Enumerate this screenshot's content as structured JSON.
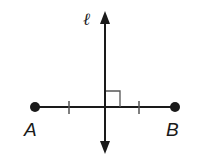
{
  "diagram": {
    "type": "perpendicular-bisector",
    "colors": {
      "stroke": "#1a1a1a",
      "background": "#ffffff",
      "marker": "#555555"
    },
    "line": {
      "label": "ℓ",
      "x": 105,
      "y_top": 12,
      "y_bottom": 153,
      "arrows": "both"
    },
    "segment": {
      "y": 107,
      "points": [
        {
          "name": "A",
          "x": 35
        },
        {
          "name": "B",
          "x": 175
        }
      ],
      "congruence_ticks": [
        69,
        139
      ]
    },
    "right_angle_marker": {
      "x": 105,
      "y": 91,
      "size": 15
    }
  }
}
